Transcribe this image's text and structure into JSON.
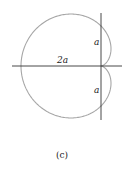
{
  "figure": {
    "caption": "(c)",
    "curve": "cardioid",
    "labels": {
      "horizontal": "2a",
      "upper": "a",
      "lower": "a"
    },
    "colors": {
      "curve": "#a6a6a6",
      "axes": "#333333",
      "text": "#222222"
    }
  }
}
